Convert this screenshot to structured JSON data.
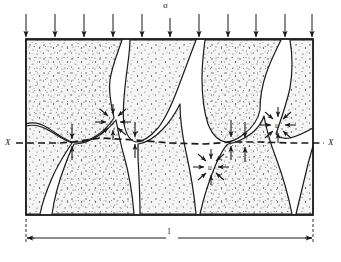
{
  "figure": {
    "type": "soil-mechanics-diagram",
    "background_color": "#ffffff",
    "line_color": "#1a1a1a",
    "grain_fill_color": "#f2f2f2",
    "stipple_color": "#333333"
  },
  "labels": {
    "applied_stress": "σ",
    "pore_pressure": "u",
    "section_left": "X",
    "section_right": "X",
    "width_dimension": "1"
  },
  "annotations": {
    "load_arrows": {
      "name": "applied-total-stress-arrows",
      "direction": "down",
      "count": 11,
      "x_positions": [
        26,
        55,
        84,
        113,
        142,
        170,
        199,
        228,
        256,
        285,
        312
      ],
      "y_top": 14,
      "y_bottom": 39
    },
    "section_line": {
      "name": "section-plane-x-x",
      "style": "dashed",
      "y": 142,
      "x_start": 16,
      "x_end": 324
    },
    "pore_pressure_clusters": [
      {
        "label": "u",
        "cx": 113,
        "cy": 122,
        "radius": 17
      },
      {
        "label": "u",
        "cx": 211,
        "cy": 167,
        "radius": 17
      },
      {
        "label": "u",
        "cx": 278,
        "cy": 125,
        "radius": 17
      }
    ],
    "contact_force_points": [
      {
        "name": "grain-contact-force",
        "x": 72,
        "y": 142
      },
      {
        "name": "grain-contact-force",
        "x": 135,
        "y": 142
      },
      {
        "name": "grain-contact-force",
        "x": 231,
        "y": 142
      },
      {
        "name": "grain-contact-force",
        "x": 245,
        "y": 142
      }
    ],
    "dimension_line": {
      "name": "unit-width-dimension",
      "y": 238,
      "x_start": 26,
      "x_end": 313
    }
  },
  "soil_box": {
    "x": 26,
    "y": 39,
    "width": 287,
    "height": 176
  }
}
